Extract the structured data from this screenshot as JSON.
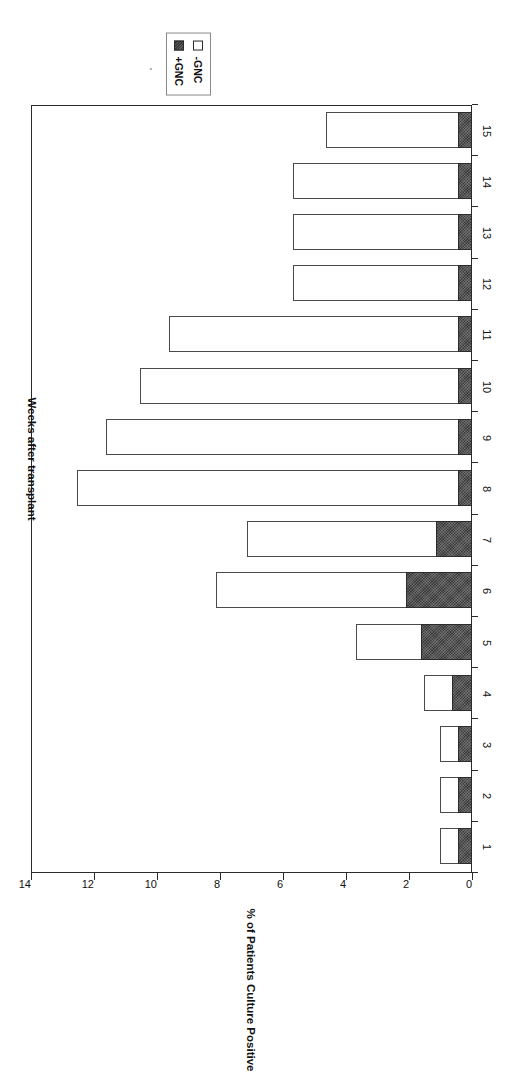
{
  "chart_data": {
    "type": "bar",
    "stacked": true,
    "orientation": "vertical",
    "title": "",
    "xlabel": "Weeks after transplant",
    "ylabel": "% of Patients Culture Positive",
    "categories": [
      "1",
      "2",
      "3",
      "4",
      "5",
      "6",
      "7",
      "8",
      "9",
      "10",
      "11",
      "12",
      "13",
      "14",
      "15"
    ],
    "ylim": [
      0,
      14
    ],
    "yticks": [
      0,
      2,
      4,
      6,
      8,
      10,
      12,
      14
    ],
    "grid": false,
    "legend_position": "top-right",
    "series": [
      {
        "name": "+GNC",
        "key": "pos",
        "color": "#3a3a3a",
        "values": [
          0.4,
          0.4,
          0.4,
          0.6,
          1.6,
          2.05,
          1.1,
          0.4,
          0.4,
          0.4,
          0.4,
          0.4,
          0.4,
          0.4,
          0.4
        ]
      },
      {
        "name": "-GNC",
        "key": "neg",
        "color": "#ffffff",
        "values": [
          0.6,
          0.6,
          0.6,
          0.9,
          2.05,
          6.05,
          6.0,
          12.1,
          11.2,
          10.1,
          9.2,
          5.25,
          5.25,
          5.25,
          4.2
        ]
      }
    ],
    "totals": [
      1.0,
      1.0,
      1.0,
      1.5,
      3.65,
      8.1,
      7.1,
      12.5,
      11.6,
      10.5,
      9.6,
      5.65,
      5.65,
      5.65,
      4.6
    ]
  },
  "legend": {
    "items": [
      {
        "label": "-GNC",
        "swatch": "open-square"
      },
      {
        "label": "+GNC",
        "swatch": "filled-square"
      }
    ]
  },
  "axes": {
    "y_label": "% of Patients Culture Positive",
    "x_label": "Weeks after transplant",
    "y_tick_labels": [
      "0",
      "2",
      "4",
      "6",
      "8",
      "10",
      "12",
      "14"
    ],
    "x_tick_labels": [
      "1",
      "2",
      "3",
      "4",
      "5",
      "6",
      "7",
      "8",
      "9",
      "10",
      "11",
      "12",
      "13",
      "14",
      "15"
    ]
  }
}
